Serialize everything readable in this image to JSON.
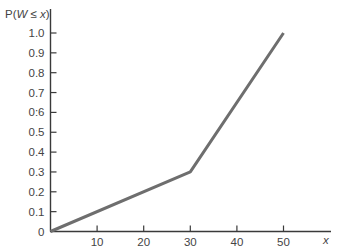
{
  "chart_data": {
    "type": "line",
    "title": "",
    "xlabel": "x",
    "ylabel": "P(W ≤ x)",
    "ylabel_parts": {
      "prefix": "P(",
      "var": "W",
      "op": " ≤ ",
      "arg": "x",
      "suffix": ")"
    },
    "xlim": [
      0,
      60
    ],
    "ylim": [
      0,
      1.1
    ],
    "x_ticks": [
      10,
      20,
      30,
      40,
      50
    ],
    "x_tick_labels": [
      "10",
      "20",
      "30",
      "40",
      "50"
    ],
    "y_ticks": [
      0,
      0.1,
      0.2,
      0.3,
      0.4,
      0.5,
      0.6,
      0.7,
      0.8,
      0.9,
      1.0
    ],
    "y_tick_labels": [
      "0",
      "0.1",
      "0.2",
      "0.3",
      "0.4",
      "0.5",
      "0:6",
      "0.7",
      "0.8",
      "0.9",
      "1.0"
    ],
    "grid": false,
    "legend": null,
    "series": [
      {
        "name": "CDF",
        "x": [
          0,
          30,
          50
        ],
        "y": [
          0,
          0.3,
          1.0
        ],
        "color": "#6e6e6e"
      }
    ]
  },
  "style": {
    "axis_color": "#3a3a3a",
    "text_color": "#444444"
  }
}
